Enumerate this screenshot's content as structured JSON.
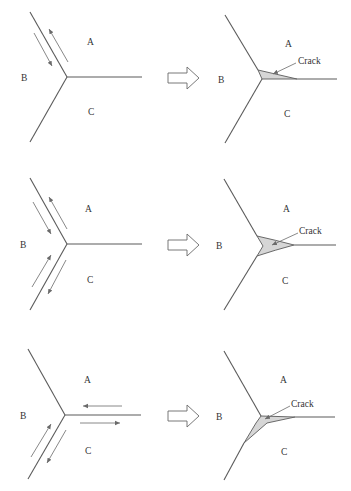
{
  "figure": {
    "grain_labels": {
      "a": "A",
      "b": "B",
      "c": "C"
    },
    "crack_label": "Crack",
    "colors": {
      "boundary": "#5a5a5a",
      "crack_fill": "#d6d6d6",
      "arrow": "#6a6a6a"
    },
    "rows": [
      {
        "id": "row-1",
        "sliding_boundary": "A-B",
        "crack_location": "A-C boundary"
      },
      {
        "id": "row-2",
        "sliding_boundaries": [
          "A-B",
          "B-C"
        ],
        "crack_location": "junction wedge"
      },
      {
        "id": "row-3",
        "sliding_boundaries": [
          "A-C",
          "B-C"
        ],
        "crack_location": "B-C and A-C boundaries"
      }
    ]
  }
}
